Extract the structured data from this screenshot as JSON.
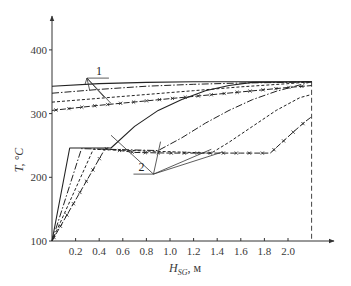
{
  "chart_data": {
    "type": "line",
    "title": "",
    "xlabel": "H_SG, м",
    "xlabel_main": "H",
    "xlabel_sub": "SG",
    "xlabel_unit": ", м",
    "ylabel": "T, °C",
    "xlim": [
      0,
      2.3
    ],
    "ylim": [
      100,
      450
    ],
    "x_ticks": [
      0.2,
      0.4,
      0.6,
      0.8,
      1.0,
      1.2,
      1.4,
      1.6,
      1.8,
      2.0
    ],
    "x_tick_labels": [
      "0.2",
      "0.4",
      "0.6",
      "0.8",
      "1.0",
      "1.2",
      "1.4",
      "1.6",
      "1.8",
      "2.0"
    ],
    "y_ticks": [
      100,
      200,
      300,
      400
    ],
    "y_tick_labels": [
      "100",
      "200",
      "300",
      "400"
    ],
    "grid": false,
    "legend": "none",
    "vertical_marker": {
      "x": 2.2,
      "style": "dashed"
    },
    "annotations": [
      {
        "text": "1",
        "x": 0.33,
        "y": 362,
        "refers_to": "primary (hot) coolant curves"
      },
      {
        "text": "2",
        "x": 0.86,
        "y": 205,
        "refers_to": "secondary (heated) fluid curves"
      }
    ],
    "series": [
      {
        "name": "primary-solid",
        "group": "1",
        "style": "solid",
        "x": [
          0,
          0.4,
          0.8,
          1.2,
          1.6,
          2.0,
          2.2
        ],
        "y": [
          343,
          347,
          349,
          350,
          350,
          350,
          350
        ]
      },
      {
        "name": "primary-dashdot",
        "group": "1",
        "style": "dashdot",
        "x": [
          0,
          0.4,
          0.8,
          1.2,
          1.6,
          2.0,
          2.2
        ],
        "y": [
          332,
          338,
          343,
          346,
          348,
          349,
          350
        ]
      },
      {
        "name": "primary-dashed",
        "group": "1",
        "style": "dashed",
        "x": [
          0,
          0.4,
          0.8,
          1.2,
          1.6,
          2.0,
          2.2
        ],
        "y": [
          318,
          324,
          330,
          336,
          342,
          347,
          350
        ]
      },
      {
        "name": "primary-cross",
        "group": "1",
        "style": "dash-cross",
        "x": [
          0,
          0.4,
          0.8,
          1.2,
          1.6,
          2.0,
          2.2
        ],
        "y": [
          305,
          313,
          320,
          327,
          334,
          341,
          344
        ]
      },
      {
        "name": "secondary-solid",
        "group": "2",
        "style": "solid",
        "x": [
          0,
          0.15,
          0.5,
          0.7,
          0.9,
          1.1,
          1.3,
          1.5,
          1.7,
          2.2
        ],
        "y": [
          100,
          246,
          246,
          280,
          305,
          322,
          336,
          344,
          349,
          350
        ]
      },
      {
        "name": "secondary-dashdot",
        "group": "2",
        "style": "dashdot",
        "x": [
          0,
          0.25,
          0.9,
          1.1,
          1.3,
          1.5,
          1.7,
          1.9,
          2.2
        ],
        "y": [
          100,
          245,
          242,
          262,
          285,
          305,
          322,
          335,
          350
        ]
      },
      {
        "name": "secondary-dashed",
        "group": "2",
        "style": "dashed",
        "x": [
          0,
          0.35,
          1.35,
          1.5,
          1.7,
          1.9,
          2.1,
          2.2
        ],
        "y": [
          100,
          244,
          238,
          255,
          280,
          305,
          325,
          330
        ]
      },
      {
        "name": "secondary-cross",
        "group": "2",
        "style": "dash-cross",
        "x": [
          0,
          0.45,
          0.7,
          1.0,
          1.3,
          1.6,
          1.85,
          1.95,
          2.05,
          2.15,
          2.2
        ],
        "y": [
          100,
          245,
          239,
          238,
          238,
          238,
          238,
          255,
          272,
          288,
          295
        ]
      }
    ]
  }
}
